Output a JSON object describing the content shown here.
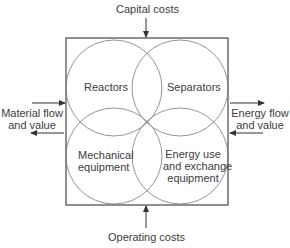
{
  "diagram": {
    "top_label": "Capital costs",
    "bottom_label": "Operating costs",
    "left_label": [
      "Material flow",
      "and value"
    ],
    "right_label": [
      "Energy flow",
      "and value"
    ],
    "circles": [
      {
        "name": "reactors",
        "lines": [
          "Reactors"
        ]
      },
      {
        "name": "separators",
        "lines": [
          "Separators"
        ]
      },
      {
        "name": "mechanical-equipment",
        "lines": [
          "Mechanical",
          "equipment"
        ]
      },
      {
        "name": "energy-use",
        "lines": [
          "Energy use",
          "and exchange",
          "equipment"
        ]
      }
    ],
    "colors": {
      "line": "#555555",
      "circle": "#7a7a7a",
      "text": "#3c3c3c"
    }
  }
}
